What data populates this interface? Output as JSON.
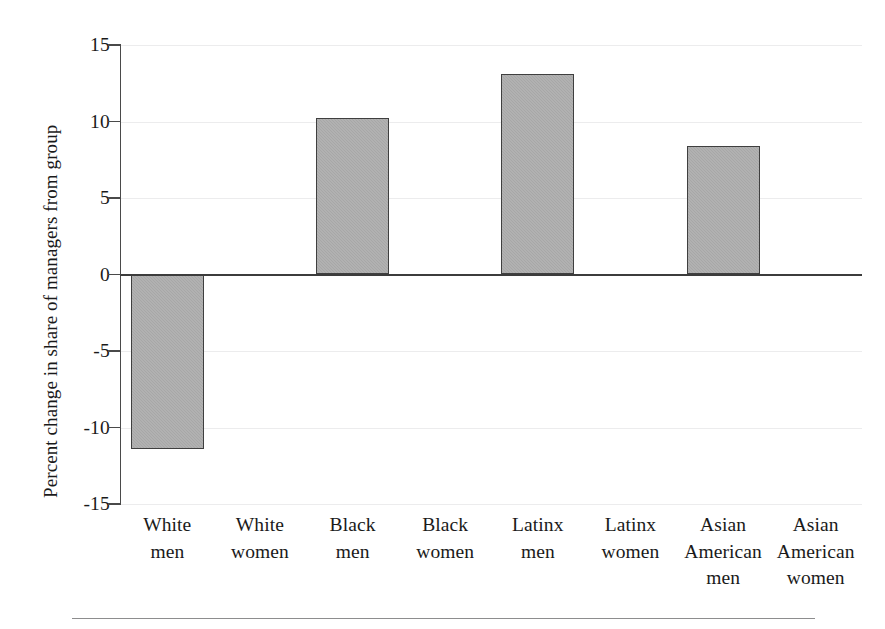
{
  "chart_data": {
    "type": "bar",
    "title": "",
    "xlabel": "",
    "ylabel": "Percent change in share of managers from group",
    "ylim": [
      -15,
      15
    ],
    "ytick_labels": [
      "15",
      "10",
      "5",
      "0",
      "-5",
      "-10",
      "-15"
    ],
    "ytick_values": [
      15,
      10,
      5,
      0,
      -5,
      -10,
      -15
    ],
    "grid": true,
    "legend": "none",
    "zero_line": true,
    "bar_fill_color": "#a7a7a7",
    "bar_edge_color": "#3f3f3f",
    "categories": [
      "White men",
      "White women",
      "Black men",
      "Black women",
      "Latinx men",
      "Latinx women",
      "Asian American men",
      "Asian American women"
    ],
    "category_lines": [
      [
        "White",
        "men"
      ],
      [
        "White",
        "women"
      ],
      [
        "Black",
        "men"
      ],
      [
        "Black",
        "women"
      ],
      [
        "Latinx",
        "men"
      ],
      [
        "Latinx",
        "women"
      ],
      [
        "Asian",
        "American",
        "men"
      ],
      [
        "Asian",
        "American",
        "women"
      ]
    ],
    "values": [
      -11.4,
      0,
      10.2,
      0,
      13.1,
      0,
      8.4,
      0
    ]
  }
}
